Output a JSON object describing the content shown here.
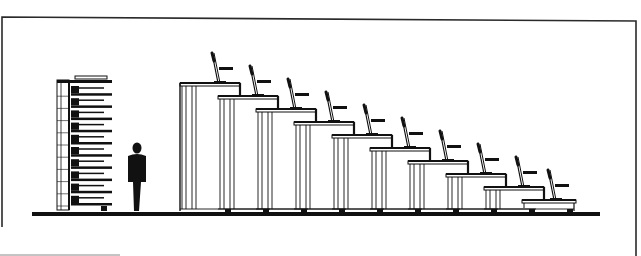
{
  "figure": {
    "kind": "elevation-drawing",
    "colors": {
      "ink": "#111111",
      "paper": "#ffffff",
      "frame": "#2a2a2a"
    },
    "frame": {
      "x": 2,
      "y": 17,
      "width": 634,
      "height": 240
    },
    "floor": {
      "x1": 32,
      "x2": 600,
      "y": 212,
      "thickness": 4
    },
    "collapsed_stack": {
      "x": 57,
      "y": 80,
      "width": 55,
      "height": 130,
      "tiers": 10,
      "top_seat_y": 76
    },
    "human_silhouette": {
      "x": 137,
      "head_y": 144,
      "feet_y": 211,
      "width": 20
    },
    "extended_rows": {
      "count": 10,
      "steps": [
        {
          "left": 180,
          "right": 240,
          "top": 83
        },
        {
          "left": 218,
          "right": 278,
          "top": 96
        },
        {
          "left": 256,
          "right": 316,
          "top": 109
        },
        {
          "left": 294,
          "right": 354,
          "top": 122
        },
        {
          "left": 332,
          "right": 392,
          "top": 135
        },
        {
          "left": 370,
          "right": 430,
          "top": 148
        },
        {
          "left": 408,
          "right": 468,
          "top": 161
        },
        {
          "left": 446,
          "right": 506,
          "top": 174
        },
        {
          "left": 484,
          "right": 544,
          "top": 187
        },
        {
          "left": 522,
          "right": 576,
          "top": 200
        }
      ],
      "wheel_positions": [
        228,
        266,
        304,
        342,
        380,
        418,
        456,
        494,
        532,
        570
      ]
    }
  }
}
